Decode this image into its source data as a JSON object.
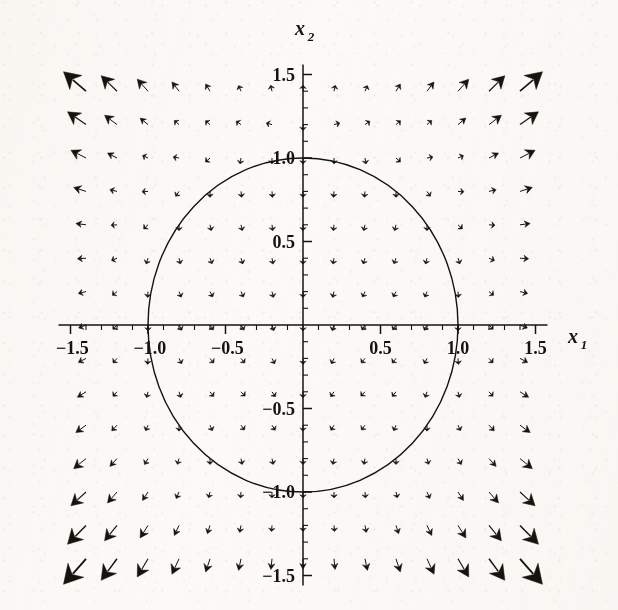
{
  "figure": {
    "kind": "phase-portrait-vector-field",
    "background_color": "#fbfaf7",
    "ink_color": "#16130f"
  },
  "axes": {
    "x_axis": {
      "name": "x1",
      "label": "x₁",
      "label_main": "x",
      "label_sub": "1",
      "min": -1.5,
      "max": 1.5,
      "tick_labels": [
        "-1.5",
        "-1.0",
        "-0.5",
        "0.5",
        "1.0",
        "1.5"
      ],
      "tick_values": [
        -1.5,
        -1.0,
        -0.5,
        0.5,
        1.0,
        1.5
      ],
      "minor_tick_step": 0.1
    },
    "y_axis": {
      "name": "x2",
      "label": "x₂",
      "label_main": "x",
      "label_sub": "2",
      "min": -1.5,
      "max": 1.5,
      "tick_labels": [
        "1.5",
        "1.0",
        "0.5",
        "-0.5",
        "-1.0",
        "-1.5"
      ],
      "tick_values": [
        1.5,
        1.0,
        0.5,
        -0.5,
        -1.0,
        -1.5
      ],
      "minor_tick_step": 0.1
    },
    "origin_px": {
      "x": 303,
      "y": 325
    },
    "scale_px_per_unit": {
      "x": 155,
      "y": 167
    }
  },
  "limit_cycle": {
    "shape": "circle",
    "center": [
      0,
      0
    ],
    "radius": 1.0,
    "stroke_width": 1.4
  },
  "chart_data": {
    "type": "scatter",
    "title": "",
    "xlabel": "x₁",
    "ylabel": "x₂",
    "xlim": [
      -1.5,
      1.5
    ],
    "ylim": [
      -1.5,
      1.5
    ],
    "grid": false,
    "legend": "none",
    "field": {
      "description": "Arrow vector field (quiver). Sample lattice of 15 x 15 points over the square [-1.4,1.4] x [-1.4,1.4]. Vectors computed from the planar system below; arrow length scales with vector magnitude.",
      "system": {
        "dx1_dt": "x1*(x1^2 + x2^2 - 1)",
        "dx2_dt": "x2*(x1^2 + x2^2 - 1) - 0.55"
      },
      "grid_n": 15,
      "grid_min": -1.4,
      "grid_max": 1.4,
      "arrow_scale": 0.42,
      "max_arrow_px": 34,
      "head_len_frac": 0.55,
      "head_width_frac": 0.5
    },
    "annotations": [
      {
        "text": "unit circle (limit cycle) r = 1",
        "x": 0,
        "y": 1.0
      }
    ]
  }
}
